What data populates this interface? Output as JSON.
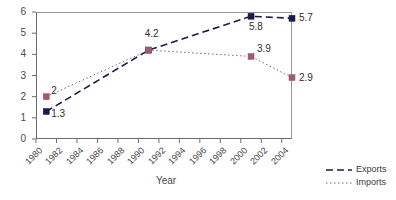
{
  "chart_data": {
    "type": "line",
    "title": "",
    "xlabel": "Year",
    "ylabel": "",
    "xlim": [
      1980,
      2005
    ],
    "ylim": [
      0,
      6
    ],
    "grid": false,
    "legend_position": "right",
    "x_ticks": [
      "1980",
      "1982",
      "1984",
      "1986",
      "1988",
      "1990",
      "1992",
      "1994",
      "1996",
      "1998",
      "2000",
      "2002",
      "2004"
    ],
    "x_tick_values": [
      1980,
      1982,
      1984,
      1986,
      1988,
      1990,
      1992,
      1994,
      1996,
      1998,
      2000,
      2002,
      2004
    ],
    "y_ticks": [
      "0",
      "1",
      "2",
      "3",
      "4",
      "5",
      "6"
    ],
    "y_tick_values": [
      0,
      1,
      2,
      3,
      4,
      5,
      6
    ],
    "x": [
      1981,
      1991,
      2001,
      2005
    ],
    "series": [
      {
        "name": "Exports",
        "color": "#1b1b4a",
        "line_style": "dashed",
        "marker": "square",
        "values": [
          1.3,
          4.2,
          5.8,
          5.7
        ],
        "point_labels": [
          "1.3",
          "",
          "5.8",
          "5.7"
        ]
      },
      {
        "name": "Imports",
        "color": "#9e5a6e",
        "line_style": "dotted",
        "marker": "square",
        "values": [
          2.0,
          4.2,
          3.9,
          2.9
        ],
        "point_labels": [
          "2",
          "4.2",
          "3.9",
          "2.9"
        ]
      }
    ],
    "annotations": [
      {
        "text": "1.3",
        "series": "Exports",
        "x": 1981,
        "y": 1.3
      },
      {
        "text": "2",
        "series": "Imports",
        "x": 1981,
        "y": 2.0
      },
      {
        "text": "4.2",
        "series": "Imports",
        "x": 1991,
        "y": 4.2
      },
      {
        "text": "5.8",
        "series": "Exports",
        "x": 2001,
        "y": 5.8
      },
      {
        "text": "3.9",
        "series": "Imports",
        "x": 2001,
        "y": 3.9
      },
      {
        "text": "5.7",
        "series": "Exports",
        "x": 2005,
        "y": 5.7
      },
      {
        "text": "2.9",
        "series": "Imports",
        "x": 2005,
        "y": 2.9
      }
    ]
  },
  "legend": {
    "items": [
      {
        "label": "Exports",
        "color": "#1b1b4a",
        "style": "dashed"
      },
      {
        "label": "Imports",
        "color": "#9e5a6e",
        "style": "dotted"
      }
    ]
  }
}
